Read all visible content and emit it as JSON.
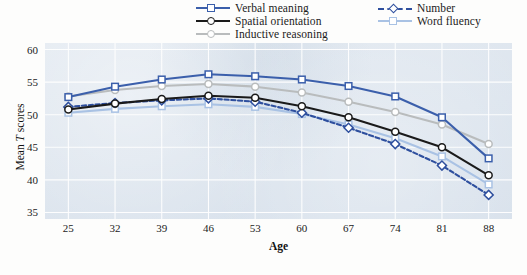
{
  "chart_data": {
    "type": "line",
    "title": "",
    "xlabel": "Age",
    "ylabel": "Mean T scores",
    "x": [
      25,
      32,
      39,
      46,
      53,
      60,
      67,
      74,
      81,
      88
    ],
    "categories": [
      "25",
      "32",
      "39",
      "46",
      "53",
      "60",
      "67",
      "74",
      "81",
      "88"
    ],
    "xlim": [
      21.5,
      91.5
    ],
    "ylim": [
      34.0,
      61.0
    ],
    "yticks": [
      35,
      40,
      45,
      50,
      55,
      60
    ],
    "ytick_labels": [
      "35",
      "40",
      "45",
      "50",
      "55",
      "60"
    ],
    "grid": true,
    "legend_position": "top-center",
    "plot_background": "#dde5ee",
    "series": [
      {
        "name": "Verbal meaning",
        "color": "#3b5fab",
        "marker": "square",
        "dash": "solid",
        "values": [
          52.7,
          54.3,
          55.4,
          56.2,
          55.9,
          55.4,
          54.4,
          52.8,
          49.6,
          43.3
        ]
      },
      {
        "name": "Spatial orientation",
        "color": "#1a1a1a",
        "marker": "circle",
        "dash": "solid",
        "values": [
          50.8,
          51.7,
          52.4,
          52.9,
          52.6,
          51.3,
          49.6,
          47.4,
          45.0,
          40.7
        ]
      },
      {
        "name": "Inductive reasoning",
        "color": "#b9bcbd",
        "marker": "circle",
        "dash": "solid",
        "values": [
          52.8,
          53.8,
          54.4,
          54.7,
          54.3,
          53.4,
          52.0,
          50.4,
          48.5,
          45.5
        ]
      },
      {
        "name": "Number",
        "color": "#2e4f9e",
        "marker": "diamond",
        "dash": "dashed",
        "values": [
          51.2,
          51.8,
          52.2,
          52.5,
          52.0,
          50.3,
          48.0,
          45.5,
          42.2,
          37.7
        ]
      },
      {
        "name": "Word fluency",
        "color": "#a9c2e4",
        "marker": "square",
        "dash": "solid",
        "values": [
          50.3,
          50.9,
          51.3,
          51.6,
          51.2,
          50.1,
          48.5,
          46.4,
          43.6,
          39.3
        ]
      }
    ]
  },
  "legend": {
    "entries": [
      {
        "label": "Verbal meaning",
        "column": 0,
        "row": 0
      },
      {
        "label": "Spatial orientation",
        "column": 0,
        "row": 1
      },
      {
        "label": "Inductive reasoning",
        "column": 0,
        "row": 2
      },
      {
        "label": "Number",
        "column": 1,
        "row": 0
      },
      {
        "label": "Word fluency",
        "column": 1,
        "row": 1
      }
    ]
  },
  "axes": {
    "x_title": "Age",
    "y_title_prefix": "Mean ",
    "y_title_italic": "T",
    "y_title_suffix": " scores"
  }
}
